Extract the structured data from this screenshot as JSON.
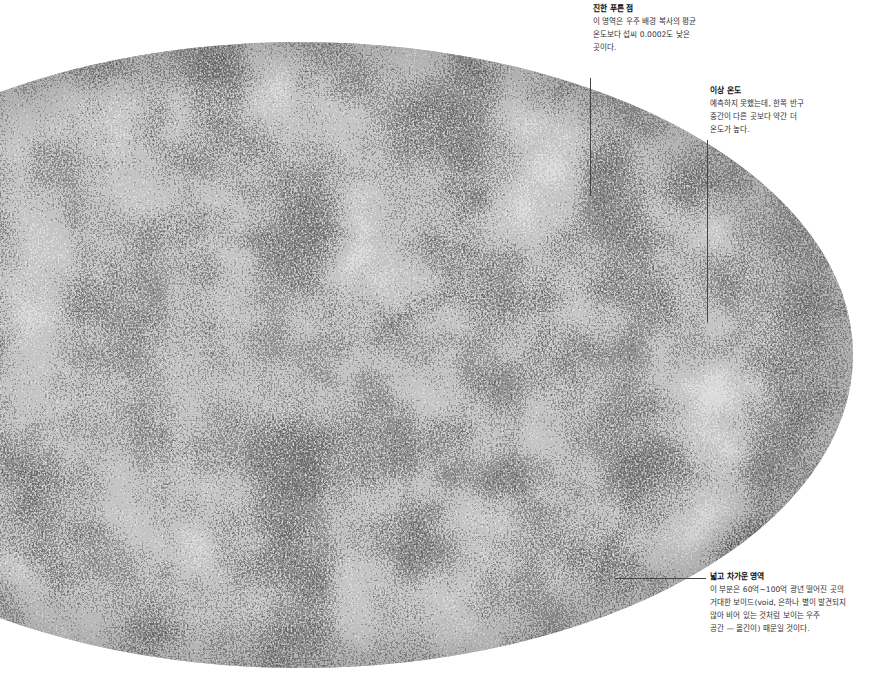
{
  "figure": {
    "projection": "mollweide-ellipse",
    "colors": {
      "background": "#ffffff",
      "map_light": "#c8c8c8",
      "map_dark": "#2a2a2a",
      "leader_line": "#444444",
      "title_text": "#111111",
      "body_text": "#333333"
    }
  },
  "annotations": [
    {
      "id": "dark-blue-spot",
      "title": "진한 푸른 점",
      "lines": [
        "이 영역은 우주 배경 복사의 평균",
        "온도보다 섭씨 0.0002도 낮은",
        "곳이다."
      ]
    },
    {
      "id": "anomalous-temperature",
      "title": "이상 온도",
      "lines": [
        "예측하지 못했는데, 한쪽 반구",
        "중간이 다른 곳보다 약간 더",
        "온도가 높다."
      ]
    },
    {
      "id": "wide-cold-region",
      "title": "넓고 차가운 영역",
      "lines": [
        "이 부분은 60억~100억 광년 떨어진 곳의",
        "거대한 보이드(void, 은하나 별이 발견되지",
        "않아 비어 있는 것처럼 보이는 우주",
        "공간 — 옮긴이) 때문일 것이다."
      ]
    }
  ]
}
